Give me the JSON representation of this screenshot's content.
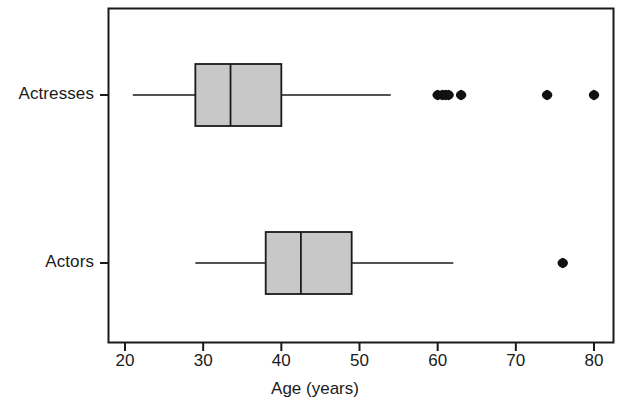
{
  "chart_data": {
    "type": "boxplot",
    "orientation": "horizontal",
    "title": "",
    "xlabel": "Age (years)",
    "ylabel": "",
    "xlim": [
      18,
      84
    ],
    "xticks": [
      20,
      30,
      40,
      50,
      60,
      70,
      80
    ],
    "xticklabels": [
      "20",
      "30",
      "40",
      "50",
      "60",
      "70",
      "80"
    ],
    "categories": [
      "Actresses",
      "Actors"
    ],
    "grid": false,
    "legend": null,
    "box_fill_color": "#c8c8c8",
    "line_color": "#1a1a1a",
    "outlier_color": "#111111",
    "frame": true,
    "series": [
      {
        "name": "Actresses",
        "whisker_low": 21,
        "q1": 29,
        "median": 33.5,
        "q3": 40,
        "whisker_high": 54,
        "outliers": [
          60,
          60.6,
          61,
          61.4,
          63,
          74,
          80
        ]
      },
      {
        "name": "Actors",
        "whisker_low": 29,
        "q1": 38,
        "median": 42.5,
        "q3": 49,
        "whisker_high": 62,
        "outliers": [
          76
        ]
      }
    ]
  },
  "axis": {
    "x_title": "Age (years)",
    "tick_20": "20",
    "tick_30": "30",
    "tick_40": "40",
    "tick_50": "50",
    "tick_60": "60",
    "tick_70": "70",
    "tick_80": "80",
    "cat_actresses": "Actresses",
    "cat_actors": "Actors"
  }
}
